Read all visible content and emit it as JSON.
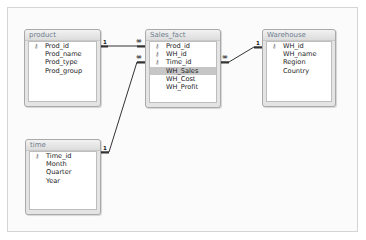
{
  "tables": {
    "product": {
      "title": "product",
      "fields": [
        {
          "name": "Prod_id",
          "key": true
        },
        {
          "name": "Prod_name",
          "key": false
        },
        {
          "name": "Prod_type",
          "key": false
        },
        {
          "name": "Prod_group",
          "key": false
        }
      ]
    },
    "sales_fact": {
      "title": "Sales_fact",
      "fields": [
        {
          "name": "Prod_id",
          "key": true
        },
        {
          "name": "WH_id",
          "key": true
        },
        {
          "name": "Time_id",
          "key": true
        },
        {
          "name": "WH_Sales",
          "key": false,
          "selected": true
        },
        {
          "name": "WH_Cost",
          "key": false
        },
        {
          "name": "WH_Profit",
          "key": false
        }
      ]
    },
    "warehouse": {
      "title": "Warehouse",
      "fields": [
        {
          "name": "WH_id",
          "key": true
        },
        {
          "name": "WH_name",
          "key": false
        },
        {
          "name": "Region",
          "key": false
        },
        {
          "name": "Country",
          "key": false
        }
      ]
    },
    "time": {
      "title": "time",
      "fields": [
        {
          "name": "Time_id",
          "key": true
        },
        {
          "name": "Month",
          "key": false
        },
        {
          "name": "Quarter",
          "key": false
        },
        {
          "name": "Year",
          "key": false
        }
      ]
    }
  },
  "relationships": [
    {
      "from": "product.Prod_id",
      "to": "Sales_fact.Prod_id",
      "one": "1",
      "many": "∞"
    },
    {
      "from": "time.Time_id",
      "to": "Sales_fact.Time_id",
      "one": "1",
      "many": "∞"
    },
    {
      "from": "Warehouse.WH_id",
      "to": "Sales_fact.WH_id",
      "one": "1",
      "many": "∞"
    }
  ],
  "icons": {
    "key": "⚷"
  },
  "colors": {
    "selected_row": "#c6c6c6",
    "title_text": "#6e7d8e",
    "line": "#333333"
  }
}
